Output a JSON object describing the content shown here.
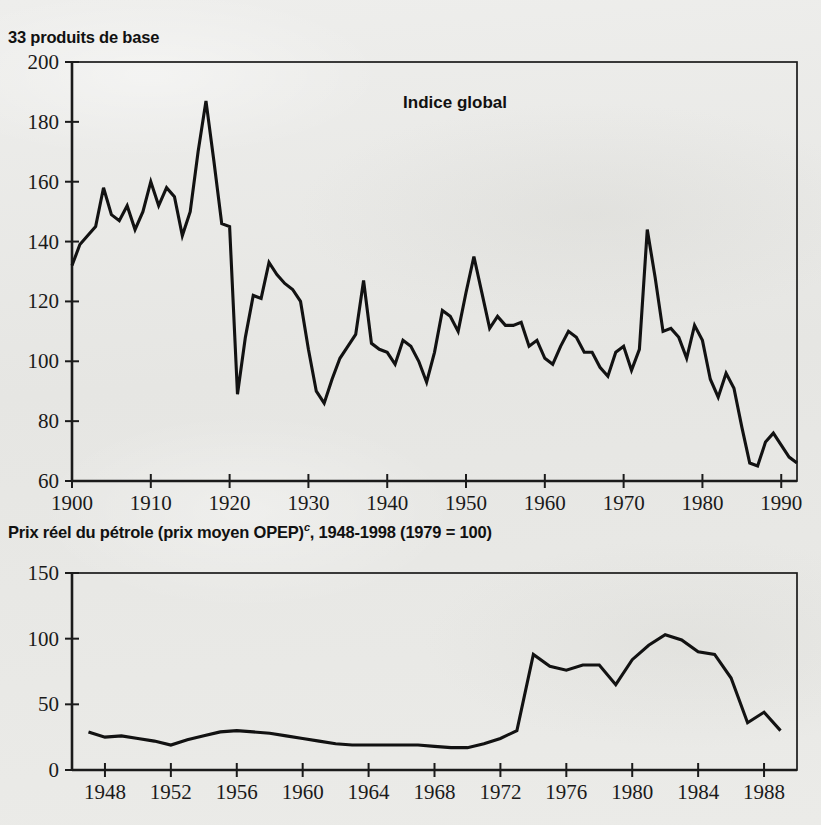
{
  "page": {
    "background_color": "#e9e9e7",
    "ink_color": "#121212"
  },
  "charts": [
    {
      "id": "commodity-index",
      "title": "33 produits de base",
      "series_label": "Indice global"
    },
    {
      "id": "oil-price",
      "title_main": "Prix réel du pétrole (prix moyen OPEP)",
      "title_superscript": "c",
      "title_tail": ", 1948-1998 (1979 = 100)"
    }
  ],
  "chart_data": [
    {
      "type": "line",
      "title": "33 produits de base",
      "subtitle": "Indice global",
      "xlabel": "",
      "ylabel": "",
      "xlim": [
        1900,
        1992
      ],
      "ylim": [
        60,
        200
      ],
      "grid": false,
      "legend": "none",
      "legend_position": "inside-top-center",
      "yticks": [
        60,
        80,
        100,
        120,
        140,
        160,
        180,
        200
      ],
      "ytick_labels": [
        "60",
        "80",
        "100",
        "120",
        "140",
        "160",
        "180",
        "200"
      ],
      "xticks": [
        1900,
        1910,
        1920,
        1930,
        1940,
        1950,
        1960,
        1970,
        1980,
        1990
      ],
      "xtick_labels": [
        "1900",
        "1910",
        "1920",
        "1930",
        "1940",
        "1950",
        "1960",
        "1970",
        "1980",
        "1990"
      ],
      "series": [
        {
          "name": "Indice global",
          "x": [
            1900,
            1901,
            1902,
            1903,
            1904,
            1905,
            1906,
            1907,
            1908,
            1909,
            1910,
            1911,
            1912,
            1913,
            1914,
            1915,
            1916,
            1917,
            1918,
            1919,
            1920,
            1921,
            1922,
            1923,
            1924,
            1925,
            1926,
            1927,
            1928,
            1929,
            1930,
            1931,
            1932,
            1933,
            1934,
            1935,
            1936,
            1937,
            1938,
            1939,
            1940,
            1941,
            1942,
            1943,
            1944,
            1945,
            1946,
            1947,
            1948,
            1949,
            1950,
            1951,
            1952,
            1953,
            1954,
            1955,
            1956,
            1957,
            1958,
            1959,
            1960,
            1961,
            1962,
            1963,
            1964,
            1965,
            1966,
            1967,
            1968,
            1969,
            1970,
            1971,
            1972,
            1973,
            1974,
            1975,
            1976,
            1977,
            1978,
            1979,
            1980,
            1981,
            1982,
            1983,
            1984,
            1985,
            1986,
            1987,
            1988,
            1989,
            1990,
            1991,
            1992
          ],
          "values": [
            132,
            139,
            142,
            145,
            158,
            149,
            147,
            152,
            144,
            150,
            160,
            152,
            158,
            155,
            142,
            150,
            170,
            187,
            167,
            146,
            145,
            89,
            108,
            122,
            121,
            133,
            129,
            126,
            124,
            120,
            104,
            90,
            86,
            94,
            101,
            105,
            109,
            127,
            106,
            104,
            103,
            99,
            107,
            105,
            100,
            93,
            103,
            117,
            115,
            110,
            123,
            135,
            123,
            111,
            115,
            112,
            112,
            113,
            105,
            107,
            101,
            99,
            105,
            110,
            108,
            103,
            103,
            98,
            95,
            103,
            105,
            97,
            104,
            144,
            128,
            110,
            111,
            108,
            101,
            112,
            107,
            94,
            88,
            96,
            91,
            78,
            66,
            65,
            73,
            76,
            72,
            68,
            66
          ]
        }
      ]
    },
    {
      "type": "line",
      "title": "Prix réel du pétrole (prix moyen OPEP)c, 1948-1998 (1979 = 100)",
      "xlabel": "",
      "ylabel": "",
      "xlim": [
        1946,
        1990
      ],
      "ylim": [
        0,
        150
      ],
      "grid": false,
      "legend": "none",
      "yticks": [
        0,
        50,
        100,
        150
      ],
      "ytick_labels": [
        "0",
        "50",
        "100",
        "150"
      ],
      "xticks": [
        1948,
        1952,
        1956,
        1960,
        1964,
        1968,
        1972,
        1976,
        1980,
        1984,
        1988
      ],
      "xtick_labels": [
        "1948",
        "1952",
        "1956",
        "1960",
        "1964",
        "1968",
        "1972",
        "1976",
        "1980",
        "1984",
        "1988"
      ],
      "series": [
        {
          "name": "Prix réel du pétrole",
          "x": [
            1947,
            1948,
            1949,
            1950,
            1951,
            1952,
            1953,
            1954,
            1955,
            1956,
            1957,
            1958,
            1959,
            1960,
            1961,
            1962,
            1963,
            1964,
            1965,
            1966,
            1967,
            1968,
            1969,
            1970,
            1971,
            1972,
            1973,
            1974,
            1975,
            1976,
            1977,
            1978,
            1979,
            1980,
            1981,
            1982,
            1983,
            1984,
            1985,
            1986,
            1987,
            1988,
            1989
          ],
          "values": [
            29,
            25,
            26,
            24,
            22,
            19,
            23,
            26,
            29,
            30,
            29,
            28,
            26,
            24,
            22,
            20,
            19,
            19,
            19,
            19,
            19,
            18,
            17,
            17,
            20,
            24,
            30,
            88,
            79,
            76,
            80,
            80,
            65,
            84,
            95,
            103,
            99,
            90,
            88,
            70,
            36,
            44,
            30
          ]
        }
      ]
    }
  ]
}
